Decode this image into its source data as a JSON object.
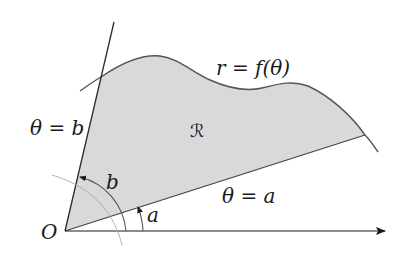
{
  "diagram": {
    "labels": {
      "curve": "r = f(θ)",
      "ray_b": "θ = b",
      "ray_a": "θ = a",
      "region": "ℛ",
      "origin": "O",
      "angle_b": "b",
      "angle_a": "a"
    },
    "colors": {
      "region_fill": "#d9d9d9",
      "stroke": "#333333",
      "curve_stroke": "#555555",
      "arc_stroke": "#666666"
    }
  }
}
